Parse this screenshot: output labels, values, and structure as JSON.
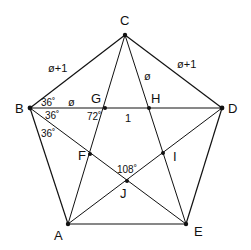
{
  "diagram": {
    "points": {
      "A": {
        "x": 68,
        "y": 224,
        "label": "A"
      },
      "B": {
        "x": 30,
        "y": 108,
        "label": "B"
      },
      "C": {
        "x": 125,
        "y": 35,
        "label": "C"
      },
      "D": {
        "x": 222,
        "y": 108,
        "label": "D"
      },
      "E": {
        "x": 186,
        "y": 224,
        "label": "E"
      },
      "F": {
        "x": 90,
        "y": 154,
        "label": "F"
      },
      "G": {
        "x": 105,
        "y": 108,
        "label": "G"
      },
      "H": {
        "x": 149,
        "y": 108,
        "label": "H"
      },
      "I": {
        "x": 163,
        "y": 153,
        "label": "I"
      },
      "J": {
        "x": 127,
        "y": 181,
        "label": "J"
      }
    },
    "edge_labels": {
      "BC": "ø+1",
      "CD": "ø+1",
      "BG": "ø",
      "CH": "ø",
      "GH": "1"
    },
    "angle_labels": {
      "B_top": "36˚",
      "B_mid": "36˚",
      "B_low": "36˚",
      "G": "72˚",
      "J": "108˚"
    }
  }
}
